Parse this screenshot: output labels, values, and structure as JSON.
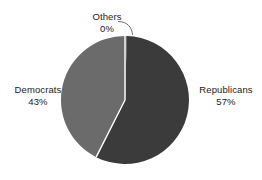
{
  "chart_data": {
    "type": "pie",
    "title": "",
    "subtitle": "",
    "xlabel": "",
    "ylabel": "",
    "grid": false,
    "legend_position": "none",
    "label_format": "name_and_percent",
    "categories": [
      "Republicans",
      "Democrats",
      "Others"
    ],
    "values": [
      57,
      43,
      0
    ],
    "units": "percent",
    "slices": [
      {
        "name": "Republicans",
        "percent_label": "57%",
        "value": 57,
        "color": "#3b3b3b",
        "start_angle_deg": 1.5,
        "end_angle_deg": 206.7,
        "label_position": "right"
      },
      {
        "name": "Democrats",
        "percent_label": "43%",
        "value": 43,
        "color": "#6b6b6b",
        "start_angle_deg": 206.7,
        "end_angle_deg": 361.5,
        "label_position": "left"
      },
      {
        "name": "Others",
        "percent_label": "0%",
        "value": 0,
        "color": "#6b6b6b",
        "start_angle_deg": 0,
        "end_angle_deg": 1.5,
        "label_position": "top",
        "has_leader_line": true
      }
    ]
  },
  "labels": {
    "others": {
      "name": "Others",
      "percent": "0%"
    },
    "democrats": {
      "name": "Democrats",
      "percent": "43%"
    },
    "republicans": {
      "name": "Republicans",
      "percent": "57%"
    }
  },
  "colors": {
    "background": "#ffffff",
    "republicans_slice": "#3b3b3b",
    "democrats_slice": "#6b6b6b",
    "separator": "#ffffff",
    "leader_line": "#5a5a5a",
    "text": "#1a1a1a"
  }
}
